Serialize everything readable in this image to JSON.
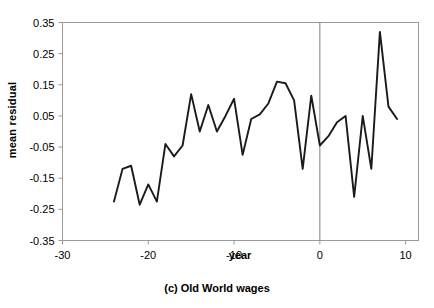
{
  "figure": {
    "caption": "(c) Old World wages",
    "background": "#ffffff",
    "frame_color": "#808080",
    "line_color": "#1a1a1a",
    "vline_color": "#808080"
  },
  "axis": {
    "y_title": "mean residual",
    "x_title": "year"
  },
  "chart_data": {
    "type": "line",
    "title": "(c) Old World wages",
    "xlabel": "year",
    "ylabel": "mean residual",
    "xlim": [
      -30,
      11.5
    ],
    "ylim": [
      -0.35,
      0.35
    ],
    "xticks": [
      -30,
      -20,
      -10,
      0,
      10
    ],
    "xticklabels": [
      "-30",
      "-20",
      "-10",
      "0",
      "10"
    ],
    "yticks": [
      -0.35,
      -0.25,
      -0.15,
      -0.05,
      0.05,
      0.15,
      0.25,
      0.35
    ],
    "yticklabels": [
      "-0.35",
      "-0.25",
      "-0.15",
      "-0.05",
      "0.05",
      "0.15",
      "0.25",
      "0.35"
    ],
    "grid": false,
    "legend": false,
    "annotations": [
      {
        "type": "vline",
        "x": 0,
        "label": "reference-year-zero"
      }
    ],
    "series": [
      {
        "name": "mean residual",
        "color": "#1a1a1a",
        "x": [
          -24,
          -23,
          -22,
          -21,
          -20,
          -19,
          -18,
          -17,
          -16,
          -15,
          -14,
          -13,
          -12,
          -11,
          -10,
          -9,
          -8,
          -7,
          -6,
          -5,
          -4,
          -3,
          -2,
          -1,
          0,
          1,
          2,
          3,
          4,
          5,
          6,
          7,
          8,
          9
        ],
        "y": [
          -0.225,
          -0.12,
          -0.11,
          -0.235,
          -0.17,
          -0.225,
          -0.04,
          -0.08,
          -0.045,
          0.12,
          0.0,
          0.085,
          0.0,
          0.05,
          0.105,
          -0.075,
          0.04,
          0.055,
          0.09,
          0.16,
          0.155,
          0.1,
          -0.12,
          0.115,
          -0.045,
          -0.015,
          0.03,
          0.05,
          -0.21,
          0.05,
          -0.12,
          0.32,
          0.08,
          0.04
        ]
      }
    ]
  }
}
